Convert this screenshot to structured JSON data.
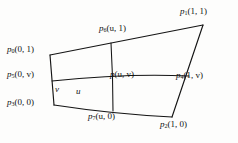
{
  "figure": {
    "stroke_color": "#141414",
    "background_color": "#fdfdfc"
  },
  "labels": {
    "corner_top_left": {
      "symbol": "p",
      "subscript": "0",
      "args": "(0, 1)"
    },
    "edge_left_mid": {
      "symbol": "p",
      "subscript": "5",
      "args": "(0, v)"
    },
    "corner_bottom_left": {
      "symbol": "p",
      "subscript": "3",
      "args": "(0, 0)"
    },
    "edge_top_mid": {
      "symbol": "p",
      "subscript": "6",
      "args": "(u, 1)"
    },
    "corner_top_right": {
      "symbol": "p",
      "subscript": "1",
      "args": "(1, 1)"
    },
    "edge_right_mid": {
      "symbol": "p",
      "subscript": "4",
      "args": "(1, v)"
    },
    "interior_point": {
      "symbol": "p",
      "subscript": "",
      "args": "(u, v)"
    },
    "edge_bottom_mid": {
      "symbol": "p",
      "subscript": "7",
      "args": "(u, 0)"
    },
    "corner_bottom_right": {
      "symbol": "p",
      "subscript": "2",
      "args": "(1, 0)"
    },
    "param_v": "v",
    "param_u": "u"
  },
  "geometry": {
    "corners": {
      "top_left": [
        50,
        55
      ],
      "top_right": [
        203,
        25
      ],
      "bottom_right": [
        172,
        117
      ],
      "bottom_left": [
        54,
        105
      ]
    },
    "edges": {
      "top": "M50,55 L203,25",
      "right": "M203,25 L172,117",
      "bottom": "M54,105 Q113,114 172,117",
      "left": "M50,55 L54,105"
    },
    "isolines": {
      "u_const": "M111,43 Q113,76 113,110",
      "v_const": "M52,81 Q128,74 189,76"
    }
  }
}
